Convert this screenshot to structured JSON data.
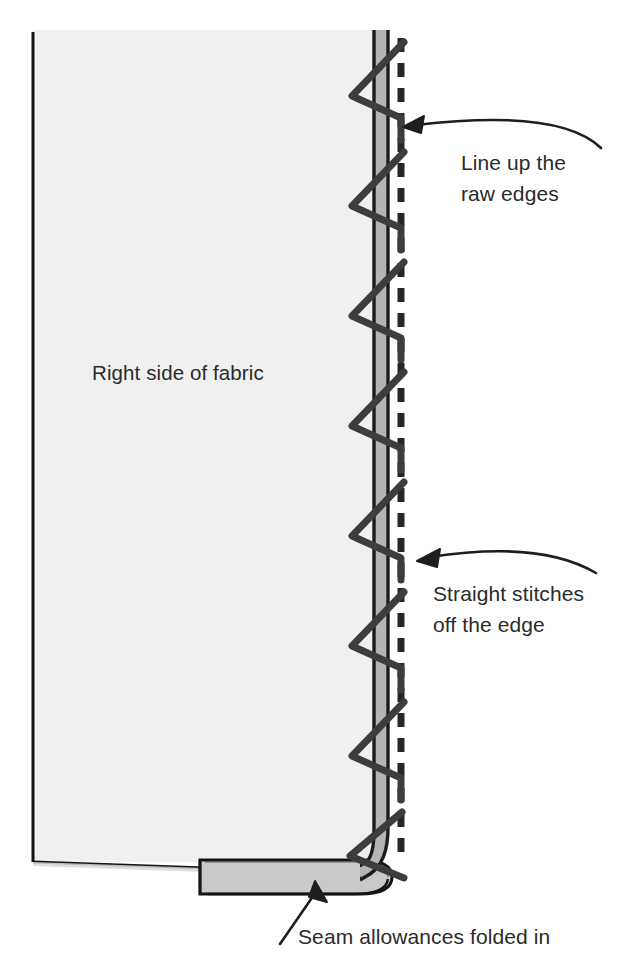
{
  "canvas": {
    "width": 635,
    "height": 975,
    "background": "#ffffff"
  },
  "illustration": {
    "title": "Zigzag finishing a folded fabric edge",
    "subject": "sewing technique diagram",
    "colors": {
      "fabric_face": "#f0f0f0",
      "fabric_edge_band": "#b4b4b4",
      "fold_flap": "#c9c9c9",
      "outline": "#1a1a1a",
      "stitch": "#3a3a3a",
      "dashed_line": "#262626",
      "text": "#2b2b2b"
    }
  },
  "labels": {
    "fabric": "Right side of fabric",
    "raw_edges_line1": "Line up the",
    "raw_edges_line2": "raw edges",
    "straight_stitches_line1": "Straight stitches",
    "straight_stitches_line2": "off the edge",
    "seam_allowances": "Seam allowances folded in"
  },
  "parts": [
    {
      "name": "fabric-panel",
      "description": "Large light gray rectangle representing the right side of the fabric",
      "x": 33,
      "y": 30,
      "width": 340,
      "height": 832
    },
    {
      "name": "edge-band",
      "description": "Narrow vertical gray band along the right raw edge, curving right at the bottom",
      "x": 373,
      "y": 30,
      "width": 15,
      "height": 845
    },
    {
      "name": "fold-flap",
      "description": "Gray rounded flap at the bottom showing the seam allowances folded in",
      "x": 200,
      "y": 858,
      "width": 188,
      "height": 38
    },
    {
      "name": "zigzag-stitch",
      "description": "Dark zigzag thread crossing the raw edge, eight repeats top to bottom",
      "repeats": 8,
      "period": 110,
      "left_apex_x": 352,
      "right_apex_x": 401
    },
    {
      "name": "dashed-stitch-line",
      "description": "Vertical dashed line at the right showing straight stitches running off the edge",
      "x": 401,
      "y_start": 38,
      "y_end": 862,
      "dash": 14,
      "gap": 11
    }
  ],
  "annotations": [
    {
      "name": "raw-edges-callout",
      "text_line1": "Line up the",
      "text_line2": "raw edges",
      "arrow": "curved-left",
      "tip_x": 403,
      "tip_y": 127
    },
    {
      "name": "straight-stitches-callout",
      "text_line1": "Straight stitches",
      "text_line2": "off the edge",
      "arrow": "curved-left",
      "tip_x": 417,
      "tip_y": 560
    },
    {
      "name": "seam-allowances-callout",
      "text_line1": "Seam allowances folded in",
      "arrow": "straight-up-right",
      "tip_x": 315,
      "tip_y": 884
    }
  ]
}
